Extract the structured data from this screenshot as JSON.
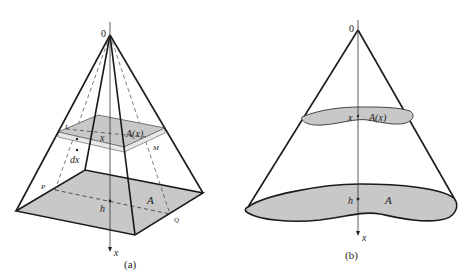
{
  "figure_a": {
    "caption": "(a)",
    "origin_label": "0",
    "slice_area_label": "A(x)",
    "slice_pos_label": "x",
    "thickness_label": "dx",
    "base_area_label": "A",
    "height_label": "h",
    "axis_label": "x",
    "point_L": "L",
    "point_M": "M",
    "point_P": "P",
    "point_Q": "Q"
  },
  "figure_b": {
    "caption": "(b)",
    "origin_label": "0",
    "slice_area_label": "A(x)",
    "slice_pos_label": "x",
    "base_area_label": "A",
    "height_label": "h",
    "axis_label": "x"
  },
  "colors": {
    "fill": "#c8c8c8",
    "stroke": "#1a1a1a"
  }
}
